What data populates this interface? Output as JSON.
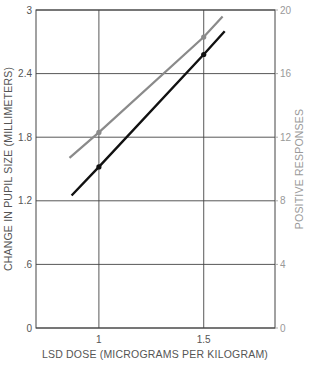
{
  "chart_data": {
    "type": "line",
    "title": "",
    "xlabel": "LSD DOSE (MICROGRAMS PER KILOGRAM)",
    "ylabel": "CHANGE IN PUPIL SIZE (MILLIMETERS)",
    "ylabel_right": "POSITIVE RESPONSES",
    "xlim": [
      0.7,
      1.84
    ],
    "ylim": [
      0,
      3
    ],
    "ylim_right": [
      0,
      20
    ],
    "x_ticks": [
      1,
      1.5
    ],
    "x_tick_labels": [
      "1",
      "1.5"
    ],
    "y_ticks": [
      0,
      0.6,
      1.2,
      1.8,
      2.4,
      3
    ],
    "y_tick_labels": [
      "0",
      ".6",
      "1.2",
      "1.8",
      "2.4",
      "3"
    ],
    "y_ticks_right": [
      0,
      4,
      8,
      12,
      16,
      20
    ],
    "y_tick_labels_right": [
      "0",
      "4",
      "8",
      "12",
      "16",
      "20"
    ],
    "grid": true,
    "legend": null,
    "series": [
      {
        "name": "Change in pupil size",
        "axis": "left",
        "color": "#111111",
        "x": [
          0.87,
          1.0,
          1.5,
          1.6
        ],
        "values": [
          1.25,
          1.52,
          2.58,
          2.8
        ],
        "markers_at": [
          1.0,
          1.5
        ]
      },
      {
        "name": "Positive responses",
        "axis": "right",
        "color": "#8a8a8a",
        "x": [
          0.86,
          1.0,
          1.5,
          1.59
        ],
        "values": [
          10.7,
          12.3,
          18.3,
          19.6
        ],
        "markers_at": [
          1.0,
          1.5
        ]
      }
    ]
  },
  "colors": {
    "grid": "#444444",
    "left_axis_text": "#555555",
    "right_axis_text": "#999999",
    "series_pupil": "#111111",
    "series_responses": "#8a8a8a"
  }
}
